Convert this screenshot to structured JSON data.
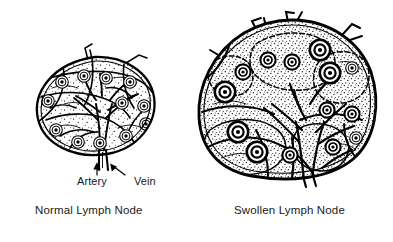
{
  "figure": {
    "style": "black-and-white pen-and-ink line drawing with stipple shading",
    "background_color": "#ffffff",
    "ink_color": "#000000"
  },
  "captions": {
    "normal": "Normal Lymph Node",
    "swollen": "Swollen Lymph Node"
  },
  "callouts": {
    "artery": {
      "label": "Artery",
      "icon": "arrow-up-icon",
      "points_to": "hilar artery of normal lymph node"
    },
    "vein": {
      "label": "Vein",
      "icon": "arrow-up-left-icon",
      "points_to": "hilar vein of normal lymph node"
    }
  },
  "panels": [
    {
      "id": "normal-lymph-node",
      "name": "Normal Lymph Node",
      "caption": "Normal Lymph Node",
      "relative_size": "small",
      "description": "Oval bean-shaped node with smooth outer capsule, internal trabeculae, a branching hilar vessel tree and small evenly spaced lymphoid follicles",
      "follicle_count": 12,
      "has_hilum": true,
      "has_afferent_vessel": true,
      "capsule_shape": "oval"
    },
    {
      "id": "swollen-lymph-node",
      "name": "Swollen Lymph Node",
      "caption": "Swollen Lymph Node",
      "relative_size": "large",
      "description": "Enlarged rounded node with bulging irregular capsule, spiky afferent lymphatic vessels at the top, dense stipple shading and numerous large dark concentric lymphoid follicles",
      "follicle_count": 17,
      "has_hilum": true,
      "has_afferent_vessel": true,
      "capsule_shape": "round-bulging"
    }
  ]
}
